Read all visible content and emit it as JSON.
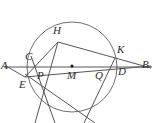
{
  "figure": {
    "type": "euclidean-geometry-diagram",
    "width": 158,
    "height": 123,
    "background_color": "#ffffff",
    "stroke_color": "#555555",
    "label_color": "#2b2b2b"
  },
  "circle": {
    "name": "main-circle",
    "center_label": "M",
    "center": {
      "x": 72,
      "y": 67
    },
    "radius": 45,
    "stroke": "#6e6e6e",
    "stroke_width": 1,
    "clipped_at_bottom": true
  },
  "points": [
    {
      "id": "A",
      "label": "A",
      "x": 6,
      "y": 67,
      "label_x": 1,
      "label_y": 61,
      "on_circle": false,
      "marked": false
    },
    {
      "id": "B",
      "label": "B",
      "x": 150,
      "y": 67,
      "label_x": 142,
      "label_y": 60,
      "on_circle": false,
      "marked": false
    },
    {
      "id": "C",
      "label": "C",
      "x": 30,
      "y": 60,
      "label_x": 25,
      "label_y": 53,
      "on_circle": true,
      "marked": false
    },
    {
      "id": "D",
      "label": "D",
      "x": 116,
      "y": 67,
      "label_x": 118,
      "label_y": 67,
      "on_circle": true,
      "marked": false
    },
    {
      "id": "E",
      "label": "E",
      "x": 25,
      "y": 76,
      "label_x": 19,
      "label_y": 79,
      "on_circle": true,
      "marked": false
    },
    {
      "id": "H",
      "label": "H",
      "x": 58,
      "y": 42,
      "label_x": 53,
      "label_y": 26,
      "on_circle": true,
      "marked": false
    },
    {
      "id": "K",
      "label": "K",
      "x": 115,
      "y": 58,
      "label_x": 117,
      "label_y": 45,
      "on_circle": true,
      "marked": false
    },
    {
      "id": "M",
      "label": "M",
      "x": 72,
      "y": 67,
      "label_x": 68,
      "label_y": 70,
      "on_circle": false,
      "marked": true
    },
    {
      "id": "P",
      "label": "P",
      "x": 42,
      "y": 67,
      "label_x": 38,
      "label_y": 70,
      "on_circle": false,
      "marked": false
    },
    {
      "id": "Q",
      "label": "Q",
      "x": 101,
      "y": 67,
      "label_x": 96,
      "label_y": 70,
      "on_circle": false,
      "marked": false
    }
  ],
  "segments": [
    {
      "id": "AB",
      "name": "secant-line-AB",
      "from": {
        "x": 4,
        "y": 67
      },
      "to": {
        "x": 152,
        "y": 67
      }
    },
    {
      "id": "AK",
      "name": "line-A-through-E-to-B",
      "from": {
        "x": 6,
        "y": 67
      },
      "to": {
        "x": 150,
        "y": 67
      }
    },
    {
      "id": "AE",
      "name": "segment-A-to-E",
      "from": {
        "x": 6,
        "y": 66
      },
      "to": {
        "x": 25,
        "y": 77
      }
    },
    {
      "id": "EK",
      "name": "chord-E-to-K-extended-to-B",
      "from": {
        "x": 25,
        "y": 77
      },
      "to": {
        "x": 151,
        "y": 66
      }
    },
    {
      "id": "HB",
      "name": "chord-H-to-K-extended-to-B",
      "from": {
        "x": 58,
        "y": 42
      },
      "to": {
        "x": 151,
        "y": 68
      }
    },
    {
      "id": "HE",
      "name": "chord-H-to-E",
      "from": {
        "x": 58,
        "y": 42
      },
      "to": {
        "x": 25,
        "y": 77
      }
    },
    {
      "id": "HP",
      "name": "chord-H-through-P-downward",
      "from": {
        "x": 58,
        "y": 42
      },
      "to": {
        "x": 35,
        "y": 123
      }
    },
    {
      "id": "KQ",
      "name": "chord-K-through-Q-downward",
      "from": {
        "x": 115,
        "y": 58
      },
      "to": {
        "x": 84,
        "y": 123
      }
    },
    {
      "id": "EL",
      "name": "chord-E-downward-right",
      "from": {
        "x": 25,
        "y": 74
      },
      "to": {
        "x": 95,
        "y": 123
      }
    },
    {
      "id": "CQ",
      "name": "chord-C-through-arc",
      "from": {
        "x": 31,
        "y": 56
      },
      "to": {
        "x": 55,
        "y": 123
      }
    }
  ],
  "labels_text": {
    "A": "A",
    "B": "B",
    "C": "C",
    "D": "D",
    "E": "E",
    "H": "H",
    "K": "K",
    "M": "M",
    "P": "P",
    "Q": "Q"
  }
}
